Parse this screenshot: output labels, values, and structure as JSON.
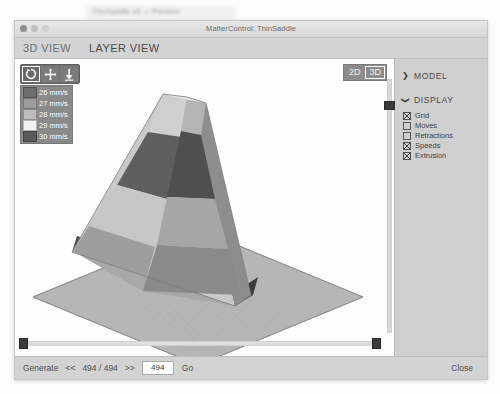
{
  "background_window": {
    "blurred_text": "ThinSaddle.stl — Preview"
  },
  "window": {
    "title": "MatterControl: ThinSaddle",
    "controls": {
      "close": "close-dot",
      "minimize": "minimize-dot",
      "zoom": "zoom-dot"
    }
  },
  "tabs": [
    {
      "label": "3D VIEW",
      "active": false
    },
    {
      "label": "LAYER VIEW",
      "active": true
    }
  ],
  "toolbar": {
    "tools": [
      {
        "name": "rotate-tool",
        "icon": "rotate-icon",
        "selected": true
      },
      {
        "name": "move-tool",
        "icon": "move-icon",
        "selected": false
      },
      {
        "name": "scale-tool",
        "icon": "scale-icon",
        "selected": false
      }
    ]
  },
  "view_toggle": {
    "options": [
      {
        "label": "2D",
        "active": false
      },
      {
        "label": "3D",
        "active": true
      }
    ]
  },
  "speed_legend": {
    "entries": [
      {
        "label": "26 mm/s",
        "color": "#6e6e6e"
      },
      {
        "label": "27 mm/s",
        "color": "#9d9d9d"
      },
      {
        "label": "28 mm/s",
        "color": "#bdbdbd"
      },
      {
        "label": "29 mm/s",
        "color": "#f2f2f2"
      },
      {
        "label": "30 mm/s",
        "color": "#5a5a5a"
      }
    ]
  },
  "options_panel": {
    "sections": [
      {
        "title": "MODEL",
        "expanded": false,
        "caret": "❯"
      },
      {
        "title": "DISPLAY",
        "expanded": true,
        "caret": "❯"
      }
    ],
    "display_items": [
      {
        "label": "Grid",
        "checked": true
      },
      {
        "label": "Moves",
        "checked": false
      },
      {
        "label": "Retractions",
        "checked": false
      },
      {
        "label": "Speeds",
        "checked": true
      },
      {
        "label": "Extrusion",
        "checked": true
      }
    ]
  },
  "layer_slider": {
    "name": "layer-slider",
    "value": 494,
    "max": 494
  },
  "bottom_bar": {
    "generate_label": "Generate",
    "prev_label": "<<",
    "counter": "494 / 494",
    "next_label": ">>",
    "layer_value": "494",
    "layer_placeholder": "494",
    "go_label": "Go",
    "close_label": "Close"
  },
  "scene": {
    "model_name": "ThinSaddle",
    "bed_color": "#b4b4b4",
    "band_colors": [
      "#cfcfcf",
      "#5f5f5f",
      "#c9c9c9",
      "#9a9a9a"
    ]
  }
}
